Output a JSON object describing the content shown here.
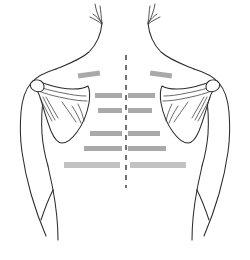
{
  "figure": {
    "view": "posterior",
    "background_color": "#ffffff",
    "outline_color": "#2b2b2b",
    "bone_fill_color": "#ffffff",
    "label_bar_color": "#a9a9a9",
    "label_bar_color_light": "#c2c2c2",
    "midline_color": "#444444"
  },
  "canvas": {
    "width": 250,
    "height": 260
  },
  "midline": {
    "name": "vertical-midline",
    "x": 126,
    "y_start": 55,
    "y_end": 188,
    "dash_pattern": "5 5"
  },
  "anatomy": {
    "parts": [
      {
        "name": "neck-outline-left",
        "side": "left"
      },
      {
        "name": "neck-outline-right",
        "side": "right"
      },
      {
        "name": "hair-strands-left",
        "side": "left"
      },
      {
        "name": "hair-strands-right",
        "side": "right"
      },
      {
        "name": "shoulder-arm-left",
        "side": "left"
      },
      {
        "name": "shoulder-arm-right",
        "side": "right"
      },
      {
        "name": "torso-flank-left",
        "side": "left"
      },
      {
        "name": "torso-flank-right",
        "side": "right"
      },
      {
        "name": "scapula-left",
        "side": "left"
      },
      {
        "name": "scapula-right",
        "side": "right"
      },
      {
        "name": "scapular-spine-left",
        "side": "left"
      },
      {
        "name": "scapular-spine-right",
        "side": "right"
      },
      {
        "name": "acromion-left",
        "side": "left"
      },
      {
        "name": "acromion-right",
        "side": "right"
      }
    ]
  },
  "label_bars": {
    "left": [
      {
        "id": "left-bar-1",
        "x": 78,
        "y": 72,
        "width": 22,
        "height": 5,
        "rotate": -8,
        "color": "#a9a9a9"
      },
      {
        "id": "left-bar-2",
        "x": 95,
        "y": 93,
        "width": 27,
        "height": 5,
        "rotate": 0,
        "color": "#a9a9a9"
      },
      {
        "id": "left-bar-3",
        "x": 98,
        "y": 108,
        "width": 24,
        "height": 5,
        "rotate": 0,
        "color": "#a9a9a9"
      },
      {
        "id": "left-bar-4",
        "x": 90,
        "y": 131,
        "width": 32,
        "height": 5,
        "rotate": 0,
        "color": "#a9a9a9"
      },
      {
        "id": "left-bar-5",
        "x": 84,
        "y": 146,
        "width": 38,
        "height": 5,
        "rotate": 0,
        "color": "#a9a9a9"
      },
      {
        "id": "left-bar-6",
        "x": 64,
        "y": 162,
        "width": 56,
        "height": 6,
        "rotate": 0,
        "color": "#c2c2c2"
      }
    ],
    "right": [
      {
        "id": "right-bar-1",
        "x": 150,
        "y": 72,
        "width": 22,
        "height": 5,
        "rotate": 8,
        "color": "#a9a9a9"
      },
      {
        "id": "right-bar-2",
        "x": 128,
        "y": 93,
        "width": 27,
        "height": 5,
        "rotate": 0,
        "color": "#a9a9a9"
      },
      {
        "id": "right-bar-3",
        "x": 128,
        "y": 108,
        "width": 24,
        "height": 5,
        "rotate": 0,
        "color": "#a9a9a9"
      },
      {
        "id": "right-bar-4",
        "x": 128,
        "y": 131,
        "width": 32,
        "height": 5,
        "rotate": 0,
        "color": "#a9a9a9"
      },
      {
        "id": "right-bar-5",
        "x": 128,
        "y": 146,
        "width": 38,
        "height": 5,
        "rotate": 0,
        "color": "#a9a9a9"
      },
      {
        "id": "right-bar-6",
        "x": 130,
        "y": 162,
        "width": 56,
        "height": 6,
        "rotate": 0,
        "color": "#c2c2c2"
      }
    ]
  }
}
